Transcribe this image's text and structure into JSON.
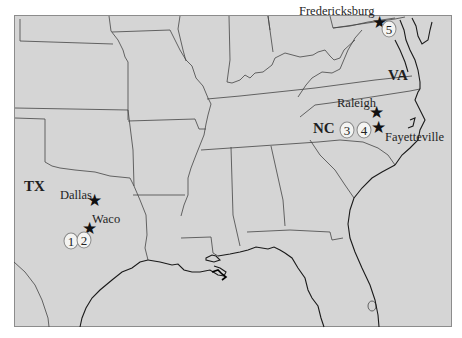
{
  "map": {
    "colors": {
      "background": "#ffffff",
      "land": "#d5d5d5",
      "frame": "#8c8c8c",
      "border_line": "#3c3c3c",
      "coast_line": "#1a1a1a",
      "marker_fill": "#f4f4f2",
      "star": "#111111"
    },
    "state_labels": [
      {
        "id": "tx",
        "text": "TX"
      },
      {
        "id": "nc",
        "text": "NC"
      },
      {
        "id": "va",
        "text": "VA"
      }
    ],
    "cities": [
      {
        "id": "fredericksburg",
        "name": "Fredericksburg",
        "icon": "star-icon"
      },
      {
        "id": "raleigh",
        "name": "Raleigh",
        "icon": "star-icon"
      },
      {
        "id": "fayetteville",
        "name": "Fayetteville",
        "icon": "star-icon"
      },
      {
        "id": "dallas",
        "name": "Dallas",
        "icon": "star-icon"
      },
      {
        "id": "waco",
        "name": "Waco",
        "icon": "star-icon"
      }
    ],
    "numbered_markers": [
      {
        "number": "1"
      },
      {
        "number": "2"
      },
      {
        "number": "3"
      },
      {
        "number": "4"
      },
      {
        "number": "5"
      }
    ],
    "star_glyph": "★"
  }
}
